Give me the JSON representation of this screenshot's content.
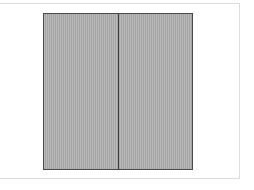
{
  "canvas": {
    "width": 254,
    "height": 190,
    "background_color": "#ffffff"
  },
  "panel_frame": {
    "label": "Drawing frame",
    "border_color": "#dcdcdc",
    "fill_color": "#ffffff",
    "border_width_px": 1,
    "x": -8,
    "y": 3,
    "width": 248,
    "height": 176
  },
  "figure": {
    "label": "Two-panel hatched rectangle",
    "outline_color": "#4a4a4a",
    "fill_color": "#a5a5a5",
    "hatch_style": "vertical-stripe",
    "hatch_spacing_px": 2,
    "x": 43,
    "y": 13,
    "width": 150,
    "height": 157,
    "leaves": [
      {
        "name": "left-leaf",
        "label": "Left panel",
        "width": 74,
        "height": 157
      },
      {
        "name": "right-leaf",
        "label": "Right panel",
        "width": 74,
        "height": 157
      }
    ],
    "divider": {
      "label": "Center mullion",
      "color": "#3c3c3c",
      "width_px": 1,
      "offset_x": 74
    }
  }
}
